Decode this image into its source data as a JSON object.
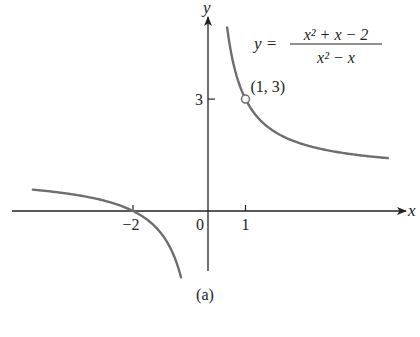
{
  "chart_data": {
    "type": "line",
    "title": "",
    "function": "y = (x^2 + x - 2) / (x^2 - x)",
    "equation_label": {
      "lhs": "y =",
      "numerator": "x² + x − 2",
      "denominator": "x² − x"
    },
    "xlabel": "x",
    "ylabel": "y",
    "x_ticks": [
      {
        "value": -2,
        "label": "−2"
      },
      {
        "value": 0,
        "label": "0"
      },
      {
        "value": 1,
        "label": "1"
      }
    ],
    "y_ticks": [
      {
        "value": 3,
        "label": "3"
      }
    ],
    "xlim": [
      -4.7,
      5.3
    ],
    "ylim": [
      -1.8,
      5.6
    ],
    "grid": false,
    "legend": "none",
    "series": [
      {
        "name": "left branch",
        "x_range": [
          -4.67,
          -0.72
        ],
        "formula": "1 + 2/x"
      },
      {
        "name": "right branch",
        "x_range": [
          0.51,
          4.8
        ],
        "formula": "1 + 2/x"
      }
    ],
    "annotations": [
      {
        "type": "open-circle",
        "x": 1,
        "y": 3,
        "label": "(1, 3)"
      }
    ],
    "caption": "(a)",
    "line_color": "#6e6e6e",
    "axis_color": "#222222"
  }
}
